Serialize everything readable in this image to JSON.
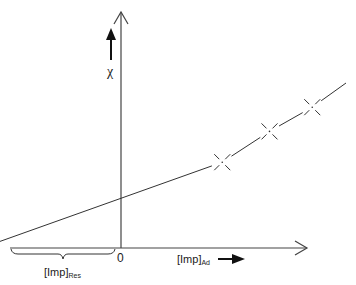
{
  "diagram": {
    "type": "linear plot schematic",
    "y_axis_label": "χ",
    "x_axis_label": {
      "main": "[Imp]",
      "subscript": "Ad"
    },
    "origin_label": "0",
    "intercept_label": {
      "main": "[Imp]",
      "subscript": "Res"
    },
    "line_color": "#333333",
    "data_markers": [
      {
        "name": "point-1",
        "x": 0.45,
        "y": 0.39
      },
      {
        "name": "point-2",
        "x": 0.66,
        "y": 0.53
      },
      {
        "name": "point-3",
        "x": 0.85,
        "y": 0.64
      }
    ],
    "line": {
      "x_intercept": -0.62,
      "y_intercept": 0.27,
      "x_end": 1.0,
      "y_end": 0.75
    }
  }
}
